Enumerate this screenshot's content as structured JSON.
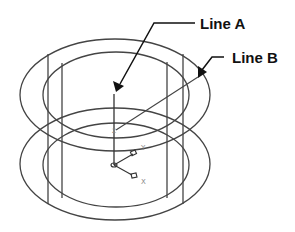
{
  "diagram": {
    "title": "",
    "labels": {
      "line_a": "Line A",
      "line_b": "Line B"
    },
    "axes": {
      "x_label": "X",
      "y_label": "Y",
      "z_label": "Z"
    },
    "colors": {
      "stroke": "#444444",
      "leader": "#111111",
      "axis_label": "#888888",
      "background": "#ffffff"
    },
    "shapes": {
      "top_outer_ellipse": {
        "cx": 115,
        "cy": 95,
        "rx": 95,
        "ry": 56
      },
      "top_inner_ellipse": {
        "cx": 116,
        "cy": 95,
        "rx": 73,
        "ry": 43
      },
      "bottom_outer_ellipse": {
        "cx": 115,
        "cy": 164,
        "rx": 95,
        "ry": 56
      },
      "bottom_inner_ellipse": {
        "cx": 116,
        "cy": 165,
        "rx": 73,
        "ry": 42
      }
    }
  }
}
